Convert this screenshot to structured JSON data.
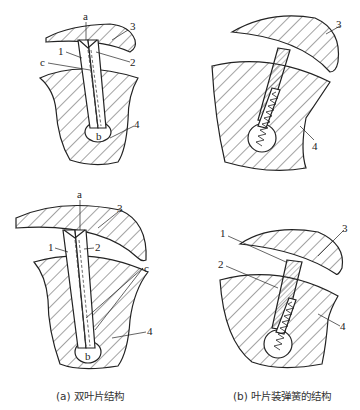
{
  "figure": {
    "panels": [
      {
        "id": "a-top",
        "labels": {
          "a": "a",
          "b": "b",
          "c": "c",
          "n1": "1",
          "n2": "2",
          "n3": "3",
          "n4": "4"
        }
      },
      {
        "id": "b-top",
        "labels": {
          "n3": "3",
          "n4": "4"
        }
      },
      {
        "id": "a-bottom",
        "labels": {
          "a": "a",
          "b": "b",
          "c": "c",
          "n1": "1",
          "n2": "2",
          "n3": "3",
          "n4": "4"
        }
      },
      {
        "id": "b-bottom",
        "labels": {
          "n1": "1",
          "n2": "2",
          "n3": "3",
          "n4": "4"
        }
      }
    ],
    "captions": {
      "left": "(a)  双叶片结构",
      "right": "(b)  叶片装弹簧的结构"
    }
  },
  "colors": {
    "line": "#222222",
    "background": "#ffffff"
  }
}
